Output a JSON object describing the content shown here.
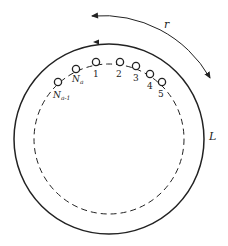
{
  "diagram": {
    "type": "circular-queue-schematic",
    "outer_ring_label": "L",
    "rotation_arc_label": "r",
    "nodes": [
      {
        "id": "n_minus_1",
        "label": "N",
        "subscript": "a-1"
      },
      {
        "id": "n",
        "label": "N",
        "subscript": "a"
      },
      {
        "id": "1",
        "label": "1"
      },
      {
        "id": "2",
        "label": "2"
      },
      {
        "id": "3",
        "label": "3"
      },
      {
        "id": "4",
        "label": "4"
      },
      {
        "id": "5",
        "label": "5"
      }
    ],
    "colors": {
      "stroke": "#222222",
      "background": "#ffffff"
    }
  }
}
